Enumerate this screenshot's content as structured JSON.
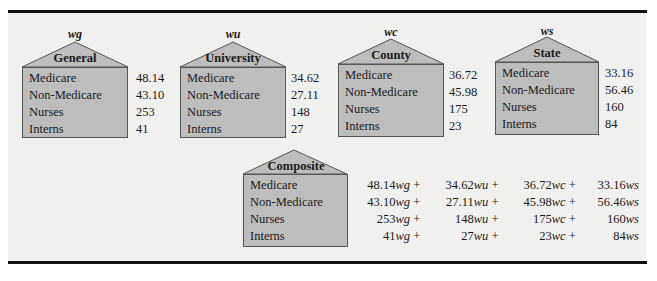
{
  "row_labels": [
    "Medicare",
    "Non-Medicare",
    "Nurses",
    "Interns"
  ],
  "houses": [
    {
      "var": "wg",
      "title": "General",
      "values": [
        "48.14",
        "43.10",
        "253",
        "41"
      ]
    },
    {
      "var": "wu",
      "title": "University",
      "values": [
        "34.62",
        "27.11",
        "148",
        "27"
      ]
    },
    {
      "var": "wc",
      "title": "County",
      "values": [
        "36.72",
        "45.98",
        "175",
        "23"
      ]
    },
    {
      "var": "ws",
      "title": "State",
      "values": [
        "33.16",
        "56.46",
        "160",
        "84"
      ]
    }
  ],
  "composite": {
    "title": "Composite",
    "equations": [
      [
        {
          "coef": "48.14",
          "var": "wg",
          "op": " + "
        },
        {
          "coef": "34.62",
          "var": "wu",
          "op": " + "
        },
        {
          "coef": "36.72",
          "var": "wc",
          "op": " + "
        },
        {
          "coef": "33.16",
          "var": "ws",
          "op": ""
        }
      ],
      [
        {
          "coef": "43.10",
          "var": "wg",
          "op": " + "
        },
        {
          "coef": "27.11",
          "var": "wu",
          "op": " + "
        },
        {
          "coef": "45.98",
          "var": "wc",
          "op": " + "
        },
        {
          "coef": "56.46",
          "var": "ws",
          "op": ""
        }
      ],
      [
        {
          "coef": "253",
          "var": "wg",
          "op": " + "
        },
        {
          "coef": "148",
          "var": "wu",
          "op": " + "
        },
        {
          "coef": "175",
          "var": "wc",
          "op": " + "
        },
        {
          "coef": "160",
          "var": "ws",
          "op": ""
        }
      ],
      [
        {
          "coef": "41",
          "var": "wg",
          "op": " + "
        },
        {
          "coef": "27",
          "var": "wu",
          "op": " + "
        },
        {
          "coef": "23",
          "var": "wc",
          "op": " + "
        },
        {
          "coef": "84",
          "var": "ws",
          "op": ""
        }
      ]
    ]
  },
  "colors": {
    "house_fill": "#bdbdbd",
    "house_stroke": "#555555",
    "panel_bg": "#f0f0ef",
    "rule": "#111111"
  }
}
